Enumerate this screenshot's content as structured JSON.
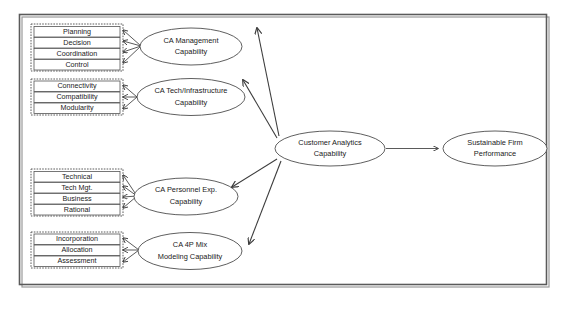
{
  "diagram": {
    "colors": {
      "frame_stroke": "#5a5a5a",
      "box_stroke": "#555555",
      "ellipse_stroke": "#4d4d4d",
      "arrow_stroke": "#3c3c3c",
      "background": "#ffffff"
    },
    "indicator_groups": [
      {
        "name": "ca-management-indicators",
        "items": [
          "Planning",
          "Decision",
          "Coordination",
          "Control"
        ]
      },
      {
        "name": "ca-tech-infrastructure-indicators",
        "items": [
          "Connectivity",
          "Compatibility",
          "Modularity"
        ]
      },
      {
        "name": "ca-personnel-expertise-indicators",
        "items": [
          "Technical",
          "Tech Mgt.",
          "Business",
          "Rational"
        ]
      },
      {
        "name": "ca-4p-mix-modeling-indicators",
        "items": [
          "Incorporation",
          "Allocation",
          "Assessment"
        ]
      }
    ],
    "constructs": [
      {
        "name": "ca-management-capability",
        "line1": "CA Management",
        "line2": "Capability"
      },
      {
        "name": "ca-tech-infrastructure-capability",
        "line1": "CA Tech/Infrastructure",
        "line2": "Capability"
      },
      {
        "name": "ca-personnel-expertise-capability",
        "line1": "CA Personnel Exp.",
        "line2": "Capability"
      },
      {
        "name": "ca-4p-mix-modeling-capability",
        "line1": "CA 4P Mix",
        "line2": "Modeling Capability"
      }
    ],
    "second_order_construct": {
      "name": "customer-analytics-capability",
      "line1": "Customer Analytics",
      "line2": "Capability"
    },
    "outcome_construct": {
      "name": "sustainable-firm-performance",
      "line1": "Sustainable Firm",
      "line2": "Performance"
    }
  }
}
